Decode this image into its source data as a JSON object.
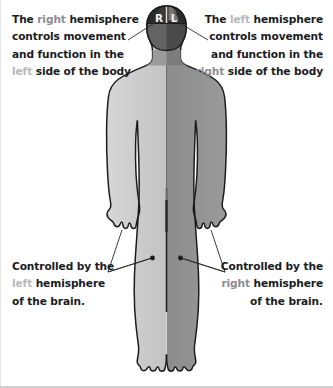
{
  "diagram": {
    "colors": {
      "body_left_half": "#cbcbcb",
      "body_right_half": "#919191",
      "outline": "#1c1c1c",
      "brain_dark": "#2b2b2b",
      "brain_mid": "#6e6e6e",
      "text": "#1a1a23",
      "text_dim": "#b7b7bb",
      "text_mid": "#8c8c92",
      "background": "#ffffff"
    }
  },
  "head_labels": {
    "right_hemisphere": "R",
    "left_hemisphere": "L"
  },
  "callouts": {
    "top_left": {
      "line1_a": "The ",
      "line1_b": "right",
      "line1_c": " hemisphere",
      "line2": "controls movement",
      "line3": "and function in the",
      "line4_a": "left",
      "line4_b": " side of the body"
    },
    "top_right": {
      "line1_a": "The ",
      "line1_b": "left",
      "line1_c": " hemisphere",
      "line2": "controls movement",
      "line3": "and function in the",
      "line4_a": "right",
      "line4_b": " side of the body"
    },
    "bottom_left": {
      "line1": "Controlled by the",
      "line2_a": "left",
      "line2_b": " hemisphere",
      "line3": "of the brain."
    },
    "bottom_right": {
      "line1": "Controlled by the",
      "line2_a": "right",
      "line2_b": " hemisphere",
      "line3": "of the brain."
    }
  }
}
